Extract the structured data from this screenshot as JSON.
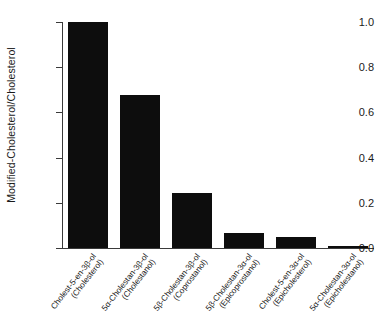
{
  "chart_data": {
    "type": "bar",
    "title": "",
    "subtitle": "",
    "xlabel": "",
    "ylabel": "Modified-Cholesterol/Cholesterol",
    "ylim": [
      0.0,
      1.0
    ],
    "grid": false,
    "legend": null,
    "y_ticks": [
      "1.0",
      "0.8",
      "0.6",
      "0.4",
      "0.2",
      "0.0"
    ],
    "y_tick_values": [
      1.0,
      0.8,
      0.6,
      0.4,
      0.2,
      0.0
    ],
    "categories": [
      "Cholest-5-en-3β-ol (Cholesterol)",
      "5α-Cholestan-3β-ol (Cholestanol)",
      "5β-Cholestan-3β-ol (Coprostanol)",
      "5β-Cholestan-3α-ol (Epicoprostanol)",
      "Cholest-5-en-3α-ol (Epicholesterol)",
      "5α-Cholestan-3α-ol (Epicholestanol)"
    ],
    "category_lines": [
      [
        "Cholest-5-en-3β-ol",
        "(Cholesterol)"
      ],
      [
        "5α-Cholestan-3β-ol",
        "(Cholestanol)"
      ],
      [
        "5β-Cholestan-3β-ol",
        "(Coprostanol)"
      ],
      [
        "5β-Cholestan-3α-ol",
        "(Epicoprostanol)"
      ],
      [
        "Cholest-5-en-3α-ol",
        "(Epicholesterol)"
      ],
      [
        "5α-Cholestan-3α-ol",
        "(Epicholestanol)"
      ]
    ],
    "values": [
      1.0,
      0.675,
      0.245,
      0.065,
      0.048,
      0.008
    ],
    "bar_color": "#0d0d0d",
    "axis_color": "#3a3a3a",
    "background": "#ffffff"
  }
}
